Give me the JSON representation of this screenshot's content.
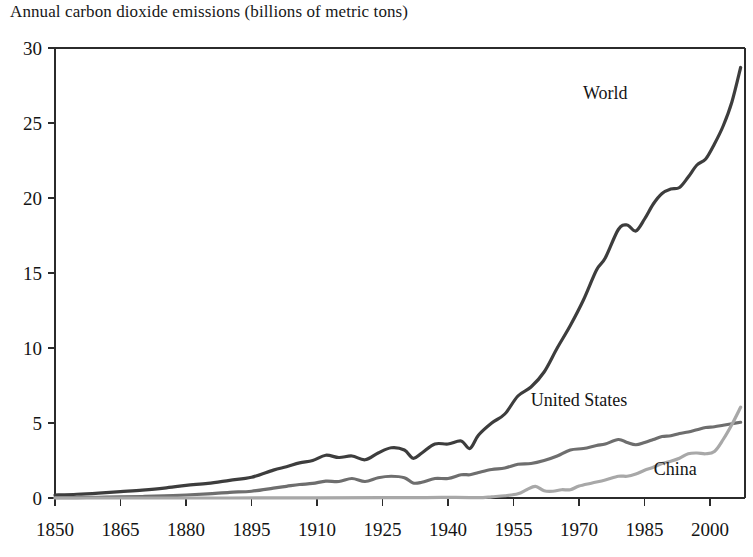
{
  "chart_data": {
    "type": "line",
    "title": "Annual carbon dioxide emissions (billions of metric tons)",
    "xlabel": "",
    "ylabel": "",
    "xlim": [
      1850,
      2008
    ],
    "ylim": [
      0,
      30
    ],
    "xticks": [
      1850,
      1865,
      1880,
      1895,
      1910,
      1925,
      1940,
      1955,
      1970,
      1985,
      2000
    ],
    "xtick_labels": [
      "1850",
      "1865",
      "1880",
      "1895",
      "1910",
      "1925",
      "1940",
      "1955",
      "1970",
      "1985",
      "2000"
    ],
    "yticks": [
      0,
      5,
      10,
      15,
      20,
      25,
      30
    ],
    "ytick_labels": [
      "0",
      "5",
      "10",
      "15",
      "20",
      "25",
      "30"
    ],
    "grid": false,
    "legend_position": "inline-annotations",
    "colors": {
      "world": "#3d3d3d",
      "united_states": "#6e6e6e",
      "china": "#a8a8a8",
      "axis": "#2b2b2b",
      "background": "#ffffff"
    },
    "series": [
      {
        "name": "World",
        "color": "#3d3d3d",
        "label_x": 1976,
        "label_y": 26.6,
        "x": [
          1850,
          1855,
          1860,
          1865,
          1870,
          1875,
          1880,
          1885,
          1890,
          1895,
          1900,
          1903,
          1906,
          1909,
          1912,
          1915,
          1918,
          1921,
          1924,
          1927,
          1930,
          1932,
          1934,
          1937,
          1940,
          1943,
          1945,
          1947,
          1950,
          1953,
          1956,
          1959,
          1962,
          1965,
          1968,
          1971,
          1974,
          1976,
          1979,
          1981,
          1983,
          1985,
          1987,
          1989,
          1991,
          1993,
          1995,
          1997,
          1999,
          2001,
          2003,
          2005,
          2007
        ],
        "values": [
          0.2,
          0.25,
          0.33,
          0.43,
          0.53,
          0.66,
          0.84,
          0.98,
          1.18,
          1.38,
          1.86,
          2.08,
          2.34,
          2.5,
          2.85,
          2.7,
          2.8,
          2.55,
          3.0,
          3.35,
          3.2,
          2.65,
          3.0,
          3.6,
          3.6,
          3.8,
          3.3,
          4.2,
          5.0,
          5.6,
          6.8,
          7.4,
          8.4,
          10.0,
          11.5,
          13.2,
          15.2,
          16.0,
          17.9,
          18.2,
          17.8,
          18.6,
          19.6,
          20.3,
          20.6,
          20.7,
          21.4,
          22.2,
          22.6,
          23.6,
          24.8,
          26.4,
          28.7
        ]
      },
      {
        "name": "United States",
        "color": "#6e6e6e",
        "label_x": 1970,
        "label_y": 6.15,
        "x": [
          1850,
          1855,
          1860,
          1865,
          1870,
          1875,
          1880,
          1885,
          1890,
          1895,
          1900,
          1903,
          1906,
          1909,
          1912,
          1915,
          1918,
          1921,
          1924,
          1927,
          1930,
          1932,
          1934,
          1937,
          1940,
          1943,
          1945,
          1947,
          1950,
          1953,
          1956,
          1959,
          1962,
          1965,
          1968,
          1971,
          1974,
          1976,
          1979,
          1981,
          1983,
          1985,
          1987,
          1989,
          1991,
          1993,
          1995,
          1997,
          1999,
          2001,
          2003,
          2005,
          2007
        ],
        "values": [
          0.02,
          0.03,
          0.05,
          0.07,
          0.1,
          0.14,
          0.2,
          0.28,
          0.38,
          0.45,
          0.66,
          0.78,
          0.9,
          0.97,
          1.12,
          1.1,
          1.3,
          1.1,
          1.35,
          1.45,
          1.35,
          1.0,
          1.05,
          1.3,
          1.3,
          1.55,
          1.55,
          1.7,
          1.9,
          2.0,
          2.25,
          2.3,
          2.5,
          2.8,
          3.2,
          3.3,
          3.5,
          3.6,
          3.9,
          3.7,
          3.55,
          3.7,
          3.9,
          4.1,
          4.15,
          4.3,
          4.4,
          4.55,
          4.7,
          4.75,
          4.85,
          4.95,
          5.05
        ]
      },
      {
        "name": "China",
        "color": "#a8a8a8",
        "label_x": 1992,
        "label_y": 1.55,
        "x": [
          1850,
          1890,
          1910,
          1925,
          1935,
          1940,
          1945,
          1948,
          1950,
          1953,
          1956,
          1958,
          1960,
          1962,
          1964,
          1966,
          1968,
          1970,
          1973,
          1976,
          1979,
          1981,
          1983,
          1985,
          1987,
          1989,
          1991,
          1993,
          1995,
          1997,
          1999,
          2001,
          2003,
          2005,
          2007
        ],
        "values": [
          0.0,
          0.0,
          0.01,
          0.02,
          0.03,
          0.04,
          0.03,
          0.03,
          0.08,
          0.15,
          0.28,
          0.55,
          0.78,
          0.48,
          0.45,
          0.55,
          0.55,
          0.8,
          1.0,
          1.2,
          1.45,
          1.45,
          1.6,
          1.85,
          2.05,
          2.3,
          2.45,
          2.65,
          2.95,
          3.0,
          2.95,
          3.1,
          3.9,
          4.9,
          6.05
        ]
      }
    ]
  }
}
